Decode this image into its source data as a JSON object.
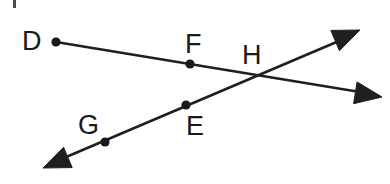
{
  "figure": {
    "type": "geometry-diagram",
    "background_color": "#ffffff",
    "stroke_color": "#1f1f1f",
    "label_color": "#1a1a1a",
    "width": 390,
    "height": 184
  },
  "labels": {
    "d": "D",
    "f": "F",
    "h": "H",
    "g": "G",
    "e": "E"
  },
  "label_positions": {
    "d": {
      "x": 22,
      "y": 50
    },
    "f": {
      "x": 185,
      "y": 53
    },
    "h": {
      "x": 242,
      "y": 64
    },
    "g": {
      "x": 78,
      "y": 134
    },
    "e": {
      "x": 186,
      "y": 135
    }
  },
  "points": {
    "d": {
      "x": 56,
      "y": 42,
      "r": 4.6
    },
    "f": {
      "x": 190,
      "y": 64,
      "r": 4.6
    },
    "g": {
      "x": 105,
      "y": 142,
      "r": 4.6
    },
    "e": {
      "x": 186,
      "y": 105,
      "r": 4.6
    }
  },
  "intersection": {
    "label": "H",
    "x": 253,
    "y": 76
  },
  "lines": {
    "line_dh": {
      "name": "ray-D-through-F-H",
      "from": {
        "x": 56,
        "y": 42
      },
      "to": {
        "x": 372,
        "y": 94
      },
      "passes_through": [
        "D",
        "F",
        "H"
      ],
      "arrow_at": "end"
    },
    "line_ge": {
      "name": "ray-through-G-E-H",
      "from": {
        "x": 52,
        "y": 163
      },
      "to": {
        "x": 353,
        "y": 35
      },
      "passes_through": [
        "G",
        "E",
        "H"
      ],
      "arrow_at": "both"
    }
  },
  "arrowheads": {
    "upper_right": {
      "tip_x": 360,
      "tip_y": 30,
      "angle_deg": -23
    },
    "lower_right": {
      "tip_x": 382,
      "tip_y": 97,
      "angle_deg": 9
    },
    "lower_left": {
      "tip_x": 43,
      "tip_y": 168,
      "angle_deg": 157
    }
  },
  "artifact": {
    "name": "scan-mark",
    "x": 13,
    "y": 0,
    "width": 3,
    "height": 8
  }
}
